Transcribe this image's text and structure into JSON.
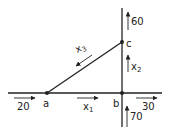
{
  "diagram": {
    "type": "network-flow",
    "colors": {
      "line": "#222222",
      "background": "#ffffff"
    },
    "nodes": [
      {
        "id": "a",
        "label": "a"
      },
      {
        "id": "b",
        "label": "b"
      },
      {
        "id": "c",
        "label": "c"
      }
    ],
    "edges": [
      {
        "from": "a",
        "to": "b",
        "var": "x",
        "sub": "1",
        "direction": "a-to-b"
      },
      {
        "from": "b",
        "to": "c",
        "var": "x",
        "sub": "2",
        "direction": "b-to-c"
      },
      {
        "from": "c",
        "to": "a",
        "var": "x",
        "sub": "3",
        "direction": "c-to-a"
      }
    ],
    "external_flows": [
      {
        "node": "a",
        "value": "20",
        "direction": "in"
      },
      {
        "node": "b",
        "value": "30",
        "direction": "out"
      },
      {
        "node": "b",
        "value": "70",
        "direction": "in"
      },
      {
        "node": "c",
        "value": "60",
        "direction": "out"
      }
    ]
  }
}
